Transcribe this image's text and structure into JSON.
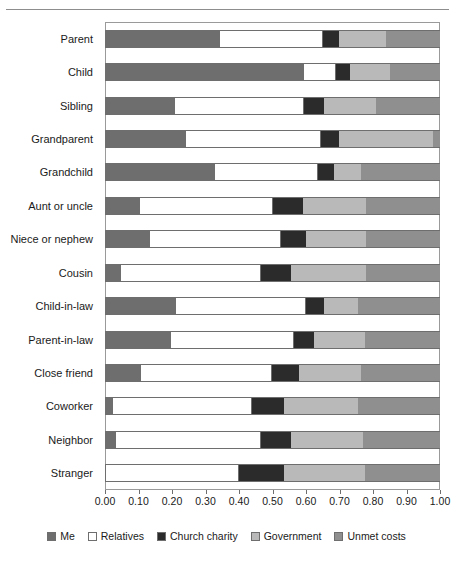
{
  "chart_data": {
    "type": "bar",
    "subtype": "horizontal-stacked-100",
    "title": "",
    "xlabel": "",
    "ylabel": "",
    "xlim": [
      0.0,
      1.0
    ],
    "grid": false,
    "legend_position": "bottom",
    "tick_labels": [
      "0.00",
      "0.10",
      "0.20",
      "0.30",
      "0.40",
      "0.50",
      "0.60",
      "0.70",
      "0.80",
      "0.90",
      "1.00"
    ],
    "tick_values": [
      0.0,
      0.1,
      0.2,
      0.3,
      0.4,
      0.5,
      0.6,
      0.7,
      0.8,
      0.9,
      1.0
    ],
    "categories": [
      "Parent",
      "Child",
      "Sibling",
      "Grandparent",
      "Grandchild",
      "Aunt or uncle",
      "Niece or nephew",
      "Cousin",
      "Child-in-law",
      "Parent-in-law",
      "Close friend",
      "Coworker",
      "Neighbor",
      "Stranger"
    ],
    "series": [
      {
        "name": "Me",
        "color": "#6e6e6e",
        "values": [
          0.34,
          0.59,
          0.205,
          0.24,
          0.325,
          0.1,
          0.13,
          0.045,
          0.21,
          0.195,
          0.105,
          0.02,
          0.03,
          0.0
        ]
      },
      {
        "name": "Relatives",
        "color": "#ffffff",
        "values": [
          0.31,
          0.1,
          0.39,
          0.405,
          0.31,
          0.4,
          0.395,
          0.42,
          0.39,
          0.37,
          0.395,
          0.42,
          0.435,
          0.4
        ]
      },
      {
        "name": "Church charity",
        "color": "#2b2b2b",
        "values": [
          0.05,
          0.04,
          0.06,
          0.055,
          0.05,
          0.09,
          0.075,
          0.09,
          0.055,
          0.06,
          0.08,
          0.095,
          0.09,
          0.135
        ]
      },
      {
        "name": "Government",
        "color": "#b9b9b9",
        "values": [
          0.14,
          0.12,
          0.155,
          0.28,
          0.08,
          0.19,
          0.18,
          0.225,
          0.1,
          0.15,
          0.185,
          0.22,
          0.215,
          0.24
        ]
      },
      {
        "name": "Unmet costs",
        "color": "#8f8f8f",
        "values": [
          0.16,
          0.15,
          0.19,
          0.02,
          0.235,
          0.22,
          0.22,
          0.22,
          0.245,
          0.225,
          0.235,
          0.245,
          0.23,
          0.225
        ]
      }
    ],
    "legend_entries": [
      "Me",
      "Relatives",
      "Church charity",
      "Government",
      "Unmet costs"
    ]
  },
  "colors": {
    "me": "#6e6e6e",
    "relatives": "#ffffff",
    "church_charity": "#2b2b2b",
    "government": "#b9b9b9",
    "unmet_costs": "#8f8f8f",
    "outline": "#6e6e6e",
    "frame": "#9a9a9a"
  }
}
